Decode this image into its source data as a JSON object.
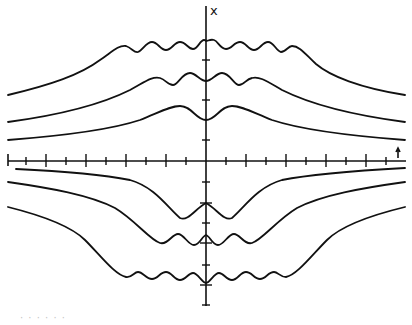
{
  "diagram": {
    "axes": {
      "vertical_label": "x",
      "horizontal_label": "t",
      "origin_px": [
        206,
        161
      ]
    },
    "curves": [
      {
        "name": "upper-outer",
        "description": "wavy plateau with many small oscillations near center"
      },
      {
        "name": "upper-middle",
        "description": "plateau with two double-bumps and central dip"
      },
      {
        "name": "upper-inner",
        "description": "two peaks with central dip"
      },
      {
        "name": "lower-inner",
        "description": "mirror of upper-inner: two troughs with central peak"
      },
      {
        "name": "lower-middle",
        "description": "mirror of upper-middle"
      },
      {
        "name": "lower-outer",
        "description": "mirror of upper-outer, wavy trough"
      }
    ],
    "colors": {
      "line": "#111111",
      "background": "#ffffff"
    },
    "caption": "· · · · · ·"
  }
}
